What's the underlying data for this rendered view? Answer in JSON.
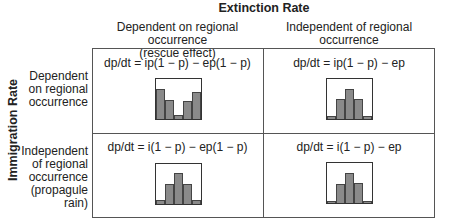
{
  "title": "Extinction Rate",
  "vertical_label": "Immigration Rate",
  "columns": [
    {
      "label_line1": "Dependent on regional occurrence",
      "label_line2": "(rescue effect)"
    },
    {
      "label_line1": "Independent of regional occurrence",
      "label_line2": ""
    }
  ],
  "rows": [
    {
      "label_lines": [
        "Dependent",
        "on regional",
        "occurrence"
      ]
    },
    {
      "label_lines": [
        "Independent",
        "of regional",
        "occurrence",
        "(propagule",
        "rain)"
      ]
    }
  ],
  "cells": [
    {
      "equation": "dp/dt = ip(1 −  p) − ep(1 − p)",
      "bars": [
        0.76,
        0.48,
        0.1,
        0.45,
        0.68
      ]
    },
    {
      "equation": "dp/dt = ip(1 − p) − ep",
      "bars": [
        0.08,
        0.5,
        0.76,
        0.5,
        0.08
      ]
    },
    {
      "equation": "dp/dt = i(1 − p) − ep(1 − p)",
      "bars": [
        0.1,
        0.5,
        0.78,
        0.5,
        0.1
      ]
    },
    {
      "equation": "dp/dt = i(1 − p) − ep",
      "bars": [
        0.06,
        0.48,
        0.76,
        0.5,
        0.06
      ]
    }
  ],
  "colors": {
    "bar_fill": "#8a8a8a",
    "border": "#555555"
  }
}
